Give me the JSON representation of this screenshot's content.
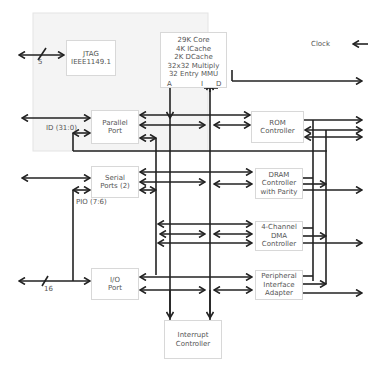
{
  "diagram": {
    "background": "#f5f5f5",
    "line_color": "#222222",
    "blocks": {
      "jtag": [
        "JTAG",
        "IEEE1149.1"
      ],
      "core": [
        "29K Core",
        "4K ICache",
        "2K DCache",
        "32x32 Multiply",
        "32 Entry MMU"
      ],
      "core_ports": {
        "a": "A",
        "i": "I",
        "d": "D"
      },
      "parallel_port": [
        "Parallel",
        "Port"
      ],
      "serial_ports": [
        "Serial",
        "Ports (2)"
      ],
      "io_port": [
        "I/O",
        "Port"
      ],
      "rom_controller": [
        "ROM",
        "Controller"
      ],
      "dram_controller": [
        "DRAM",
        "Controller",
        "with Parity"
      ],
      "dma_controller": [
        "4-Channel",
        "DMA Controller"
      ],
      "pia": [
        "Peripheral",
        "Interface",
        "Adapter"
      ],
      "interrupt_controller": [
        "Interrupt",
        "Controller"
      ]
    },
    "labels": {
      "clock": "Clock",
      "jtag_bus_width": "5",
      "id_bus": "ID (31:0)",
      "pio_bus": "PIO (7:6)",
      "io_bus_width": "16"
    }
  }
}
